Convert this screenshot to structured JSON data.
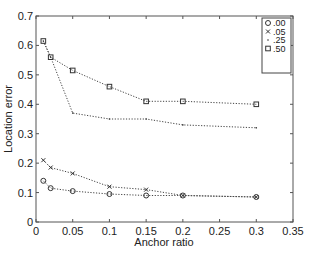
{
  "chart_data": {
    "type": "line",
    "title": "",
    "xlabel": "Anchor ratio",
    "ylabel": "Location error",
    "xlim": [
      0,
      0.35
    ],
    "ylim": [
      0,
      0.7
    ],
    "xticks": [
      "0",
      "0.05",
      "0.1",
      "0.15",
      "0.2",
      "0.25",
      "0.3",
      "0.35"
    ],
    "yticks": [
      "0",
      "0.1",
      "0.2",
      "0.3",
      "0.4",
      "0.5",
      "0.6",
      "0.7"
    ],
    "grid": false,
    "legend_position": "upper right",
    "x": [
      0.01,
      0.02,
      0.05,
      0.1,
      0.15,
      0.2,
      0.3
    ],
    "series": [
      {
        "name": ".00",
        "marker": "o",
        "values": [
          0.14,
          0.115,
          0.105,
          0.095,
          0.09,
          0.09,
          0.085
        ]
      },
      {
        "name": ".05",
        "marker": "x",
        "values": [
          0.21,
          0.185,
          0.165,
          0.12,
          0.11,
          0.09,
          0.085
        ]
      },
      {
        "name": ".25",
        "marker": ".",
        "values": [
          0.615,
          0.56,
          0.37,
          0.35,
          0.35,
          0.33,
          0.32
        ]
      },
      {
        "name": ".50",
        "marker": "s",
        "values": [
          0.615,
          0.56,
          0.515,
          0.46,
          0.41,
          0.41,
          0.4
        ]
      }
    ]
  }
}
